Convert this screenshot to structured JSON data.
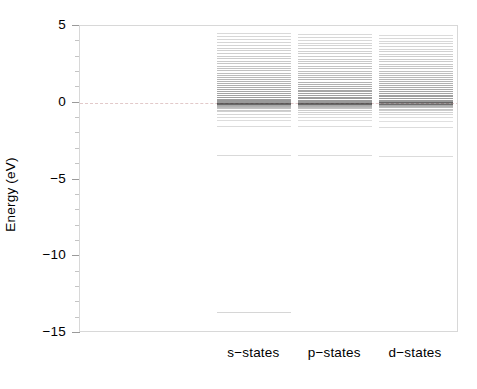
{
  "chart_data": {
    "type": "bar",
    "title": "",
    "subtitle": "",
    "xlabel": "",
    "ylabel": "Energy (eV)",
    "ylim": [
      -15,
      5
    ],
    "xlim": [
      0,
      3
    ],
    "grid": false,
    "legend": null,
    "y_ticks_major": [
      5,
      0,
      -5,
      -10,
      -15
    ],
    "y_tick_labels": [
      "5",
      "0",
      "-5",
      "-10",
      "-15"
    ],
    "y_ticks_minor": [
      4,
      3,
      2,
      1,
      -1,
      -2,
      -3,
      -4,
      -6,
      -7,
      -8,
      -9,
      -11,
      -12,
      -13,
      -14
    ],
    "categories": [
      "s-states",
      "p-states",
      "d-states"
    ],
    "reference_line": {
      "y": 0,
      "style": "dashed",
      "color": "#e2c9c9",
      "label": "Fermi level"
    },
    "series": [
      {
        "name": "s-states",
        "x_center": 1.38,
        "levels": [
          4.53,
          4.33,
          4.13,
          3.95,
          3.76,
          3.59,
          3.41,
          3.24,
          3.07,
          2.9,
          2.74,
          2.58,
          2.42,
          2.27,
          2.12,
          1.97,
          1.82,
          1.68,
          1.54,
          1.4,
          1.26,
          1.13,
          1.0,
          0.87,
          0.74,
          0.62,
          0.5,
          0.38,
          0.27,
          0.17,
          0.09,
          0.04,
          0.01,
          -0.02,
          -0.05,
          -0.09,
          -0.14,
          -0.2,
          -0.27,
          -0.35,
          -0.45,
          -0.57,
          -0.72,
          -0.9,
          -1.12,
          -1.5,
          -3.4,
          -13.6
        ],
        "weights": [
          0.3,
          0.32,
          0.33,
          0.35,
          0.36,
          0.38,
          0.4,
          0.42,
          0.44,
          0.46,
          0.48,
          0.5,
          0.52,
          0.55,
          0.57,
          0.6,
          0.63,
          0.66,
          0.69,
          0.72,
          0.75,
          0.78,
          0.81,
          0.84,
          0.87,
          0.9,
          0.93,
          0.96,
          0.98,
          1.0,
          1.0,
          1.0,
          1.0,
          1.0,
          0.98,
          0.92,
          0.84,
          0.74,
          0.64,
          0.55,
          0.47,
          0.4,
          0.34,
          0.29,
          0.25,
          0.28,
          0.3,
          0.34
        ]
      },
      {
        "name": "p-states",
        "x_center": 2.02,
        "levels": [
          4.5,
          4.3,
          4.11,
          3.92,
          3.74,
          3.56,
          3.39,
          3.22,
          3.05,
          2.88,
          2.72,
          2.56,
          2.4,
          2.25,
          2.1,
          1.95,
          1.8,
          1.66,
          1.52,
          1.38,
          1.25,
          1.12,
          0.99,
          0.86,
          0.74,
          0.62,
          0.5,
          0.39,
          0.28,
          0.18,
          0.1,
          0.05,
          0.01,
          -0.03,
          -0.06,
          -0.1,
          -0.15,
          -0.21,
          -0.28,
          -0.36,
          -0.46,
          -0.58,
          -0.73,
          -0.91,
          -1.14,
          -1.52,
          -3.42
        ],
        "weights": [
          0.3,
          0.32,
          0.33,
          0.35,
          0.36,
          0.38,
          0.4,
          0.42,
          0.44,
          0.46,
          0.48,
          0.5,
          0.53,
          0.55,
          0.58,
          0.61,
          0.64,
          0.67,
          0.7,
          0.73,
          0.76,
          0.79,
          0.82,
          0.85,
          0.88,
          0.91,
          0.94,
          0.97,
          0.99,
          1.0,
          1.0,
          1.0,
          1.0,
          1.0,
          0.97,
          0.91,
          0.83,
          0.73,
          0.63,
          0.54,
          0.46,
          0.39,
          0.33,
          0.28,
          0.24,
          0.27,
          0.29
        ]
      },
      {
        "name": "d-states",
        "x_center": 2.66,
        "levels": [
          4.42,
          4.23,
          4.05,
          3.87,
          3.69,
          3.52,
          3.35,
          3.18,
          3.02,
          2.86,
          2.7,
          2.54,
          2.39,
          2.24,
          2.09,
          1.94,
          1.8,
          1.66,
          1.52,
          1.39,
          1.26,
          1.13,
          1.0,
          0.88,
          0.76,
          0.64,
          0.53,
          0.42,
          0.31,
          0.21,
          0.12,
          0.06,
          0.02,
          -0.02,
          -0.06,
          -0.11,
          -0.16,
          -0.23,
          -0.3,
          -0.39,
          -0.49,
          -0.61,
          -0.76,
          -0.94,
          -1.18,
          -1.55,
          -3.45
        ],
        "weights": [
          0.28,
          0.3,
          0.31,
          0.33,
          0.35,
          0.36,
          0.38,
          0.4,
          0.42,
          0.44,
          0.46,
          0.49,
          0.51,
          0.54,
          0.56,
          0.59,
          0.62,
          0.65,
          0.68,
          0.71,
          0.74,
          0.77,
          0.8,
          0.83,
          0.86,
          0.89,
          0.92,
          0.95,
          0.97,
          1.0,
          1.0,
          1.0,
          1.0,
          0.99,
          0.96,
          0.9,
          0.81,
          0.71,
          0.61,
          0.52,
          0.44,
          0.37,
          0.31,
          0.27,
          0.23,
          0.26,
          0.28
        ]
      }
    ]
  },
  "axes": {
    "y_title": "Energy (eV)"
  }
}
